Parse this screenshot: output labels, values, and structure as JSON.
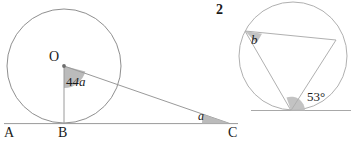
{
  "figure": {
    "background_color": "#ffffff",
    "stroke_color": "#8a8a8a",
    "baseline_color": "#9a9a9a",
    "wedge_fill": "#b9b9b9",
    "text_color": "#1a1a1a",
    "problem_number": "2"
  },
  "left_diagram": {
    "name": "circle-with-external-point",
    "circle": {
      "cx": 64,
      "cy": 66,
      "r": 57
    },
    "center_label": "O",
    "points": [
      {
        "name": "A",
        "label": "A",
        "x": 10,
        "y": 123
      },
      {
        "name": "B",
        "label": "B",
        "x": 64,
        "y": 123
      },
      {
        "name": "C",
        "label": "C",
        "x": 230,
        "y": 123
      }
    ],
    "central_angle": {
      "label": "4a",
      "value_text": "4a",
      "at": "O",
      "vertex_x": 64,
      "vertex_y": 66
    },
    "external_angle": {
      "label": "a",
      "value_text": "a",
      "at": "C",
      "vertex_x": 230,
      "vertex_y": 123
    },
    "segments": [
      {
        "name": "tangent-line-ABC",
        "from": "A",
        "to": "C"
      },
      {
        "name": "radius-OB",
        "from": "O",
        "to": "B"
      },
      {
        "name": "line-OC",
        "from": "O",
        "to": "C"
      }
    ]
  },
  "right_diagram": {
    "name": "circle-with-inscribed-triangle",
    "circle": {
      "cx": 293,
      "cy": 56,
      "r": 54
    },
    "tangent_line_y": 110,
    "tangent_point": {
      "x": 291,
      "y": 110
    },
    "vertices": [
      {
        "name": "vertex-b",
        "x": 245,
        "y": 31
      },
      {
        "name": "vertex-right",
        "x": 336,
        "y": 40
      },
      {
        "name": "vertex-tangent",
        "x": 291,
        "y": 110
      }
    ],
    "inscribed_angle": {
      "label": "b",
      "value_text": "b",
      "at": "vertex-b"
    },
    "tangent_chord_angle": {
      "label": "53°",
      "value_text": "53°",
      "at": "vertex-tangent"
    },
    "segments": [
      {
        "name": "chord-top",
        "from": "vertex-b",
        "to": "vertex-right"
      },
      {
        "name": "chord-left",
        "from": "vertex-b",
        "to": "vertex-tangent"
      },
      {
        "name": "chord-right",
        "from": "vertex-right",
        "to": "vertex-tangent"
      },
      {
        "name": "tangent-line",
        "from_x": 253,
        "to_x": 351,
        "y": 110
      }
    ]
  }
}
